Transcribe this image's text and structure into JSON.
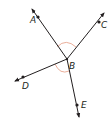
{
  "diagram": {
    "type": "geometry-rays",
    "vertex": {
      "label": "B",
      "x": 67,
      "y": 59,
      "label_x": 69,
      "label_y": 69
    },
    "colors": {
      "line": "#231f20",
      "arc": "#e8a58f",
      "background": "#ffffff"
    },
    "rays": [
      {
        "name": "A",
        "label": "A",
        "tip": [
          32,
          9
        ],
        "point": [
          38,
          17
        ],
        "label_pos": [
          30,
          23
        ]
      },
      {
        "name": "C",
        "label": "C",
        "tip": [
          104,
          13
        ],
        "point": [
          99,
          22
        ],
        "label_pos": [
          101,
          28
        ]
      },
      {
        "name": "D",
        "label": "D",
        "tip": [
          15,
          81
        ],
        "point": [
          23,
          77
        ],
        "label_pos": [
          22,
          89
        ]
      },
      {
        "name": "E",
        "label": "E",
        "tip": [
          79,
          117
        ],
        "point": [
          77,
          105
        ],
        "label_pos": [
          81,
          108
        ]
      }
    ],
    "angle_marks": [
      {
        "between": [
          "A",
          "C"
        ],
        "description": "arc above B marking angle ABC"
      },
      {
        "between": [
          "D",
          "E"
        ],
        "description": "arc below B marking angle DBE"
      }
    ]
  }
}
